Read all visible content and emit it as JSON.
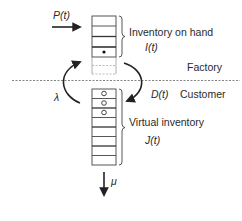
{
  "diagram": {
    "type": "inventory-flow",
    "regions": {
      "upper": "Factory",
      "lower": "Customer"
    },
    "labels": {
      "production_rate": "P(t)",
      "inventory_on_hand": "Inventory on hand",
      "inventory_on_hand_symbol": "I(t)",
      "factory": "Factory",
      "customer": "Customer",
      "demand": "D(t)",
      "arrival_rate": "λ",
      "virtual_inventory": "Virtual inventory",
      "virtual_inventory_symbol": "J(t)",
      "service_rate": "μ"
    },
    "factory_stack": {
      "solid_cells": 5,
      "dashed_cells": 2,
      "filled_dot_cell_index": 4
    },
    "customer_stack": {
      "cells": 8,
      "open_circle_cells": [
        0,
        1,
        2
      ]
    },
    "colors": {
      "line": "#333333",
      "text": "#2a2a2a",
      "dashed": "#777777"
    }
  }
}
